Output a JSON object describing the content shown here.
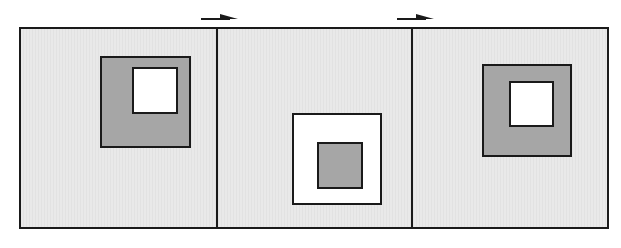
{
  "diagram": {
    "colors": {
      "background": "#e6e6e6",
      "dark_fill": "#a6a6a6",
      "light_fill": "#ffffff",
      "stroke": "#1a1a1a"
    },
    "panels": [
      {
        "id": 1,
        "outer_square_fill": "dark",
        "inner_square_fill": "light",
        "position": "upper-center-right"
      },
      {
        "id": 2,
        "outer_square_fill": "light",
        "inner_square_fill": "dark",
        "position": "lower-center"
      },
      {
        "id": 3,
        "outer_square_fill": "dark",
        "inner_square_fill": "light",
        "position": "upper-center"
      }
    ],
    "arrows": [
      {
        "from_panel": 1,
        "to_panel": 2,
        "direction": "right"
      },
      {
        "from_panel": 2,
        "to_panel": 3,
        "direction": "right"
      }
    ]
  }
}
